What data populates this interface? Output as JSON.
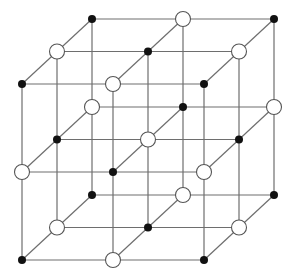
{
  "diagram": {
    "title": "",
    "grid_size": 3,
    "projection": {
      "origin": [
        22,
        84
      ],
      "step_x": [
        91,
        0
      ],
      "step_y": [
        0,
        88
      ],
      "step_z": [
        35,
        -32.5
      ]
    },
    "colors": {
      "line": "#6e6e6e",
      "filled_atom": "#111111",
      "hollow_atom_fill": "#ffffff",
      "hollow_atom_stroke": "#555555",
      "background": "#ffffff"
    },
    "atoms": {
      "filled_radius": 4,
      "hollow_radius": 7.5,
      "rule": "even (i+j+k) parity -> filled black; odd parity -> hollow white"
    },
    "legend": []
  }
}
